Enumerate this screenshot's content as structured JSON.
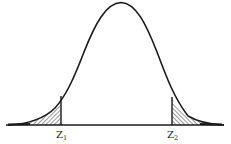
{
  "diagram": {
    "type": "normal-distribution-two-tailed",
    "curve": "bell curve (standard normal density)",
    "shaded_regions": [
      "left tail below z1",
      "right tail above z2"
    ],
    "labels": {
      "left_cutoff": {
        "base": "Z",
        "sub": "1"
      },
      "right_cutoff": {
        "base": "Z",
        "sub": "2"
      }
    },
    "colors": {
      "line": "#1a1a1a",
      "hatch": "#1a1a1a",
      "background": "#ffffff"
    }
  }
}
